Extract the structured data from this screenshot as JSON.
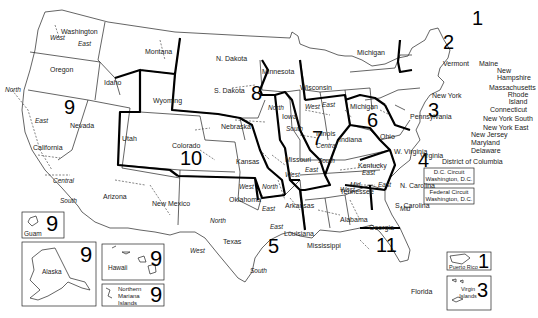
{
  "map": {
    "title": "Federal Judicial Circuits and Districts",
    "circuit_numbers": {
      "c1": "1",
      "c2": "2",
      "c3": "3",
      "c4": "4",
      "c5": "5",
      "c6": "6",
      "c7": "7",
      "c8": "8",
      "c9": "9",
      "c10": "10",
      "c11": "11"
    },
    "states": {
      "washington": "Washington",
      "oregon": "Oregon",
      "idaho": "Idaho",
      "montana": "Montana",
      "wyoming": "Wyoming",
      "nevada": "Nevada",
      "california": "California",
      "utah": "Utah",
      "colorado": "Colorado",
      "arizona": "Arizona",
      "new_mexico": "New Mexico",
      "n_dakota": "N. Dakota",
      "s_dakota": "S. Dakota",
      "nebraska": "Nebraska",
      "kansas": "Kansas",
      "oklahoma": "Oklahoma",
      "texas": "Texas",
      "minnesota": "Minnesota",
      "iowa": "Iowa",
      "missouri": "Missouri",
      "arkansas": "Arkansas",
      "louisiana": "Louisiana",
      "wisconsin": "Wisconsin",
      "illinois": "Illinois",
      "michigan": "Michigan",
      "indiana": "Indiana",
      "ohio": "Ohio",
      "kentucky": "Kentucky",
      "tennessee": "Tennessee",
      "mississippi": "Mississippi",
      "alabama": "Alabama",
      "georgia": "Georgia",
      "florida": "Florida",
      "s_carolina": "S. Carolina",
      "n_carolina": "N. Carolina",
      "virginia": "Virginia",
      "w_virginia": "W. Virginia",
      "pennsylvania": "Pennsylvania",
      "new_york": "New York",
      "vermont": "Vermont",
      "maine": "Maine",
      "new_hampshire": "New Hampshire",
      "massachusetts": "Massachusetts",
      "rhode_island": "Rhode Island",
      "connecticut": "Connecticut",
      "new_york_south": "New York South",
      "new_york_east": "New York East",
      "new_jersey": "New Jersey",
      "maryland": "Maryland",
      "delaware": "Delaware",
      "dc": "District of Columbia"
    },
    "districts": {
      "west": "West",
      "east": "East",
      "north": "North",
      "south": "South",
      "central": "Central",
      "mid": "Mid"
    },
    "insets": {
      "guam": {
        "label": "Guam",
        "circuit": "9"
      },
      "alaska": {
        "label": "Alaska",
        "circuit": "9"
      },
      "hawaii": {
        "label": "Hawaii",
        "circuit": "9"
      },
      "nmi": {
        "label": "Northern Mariana Islands",
        "circuit": "9"
      },
      "puerto_rico": {
        "label": "Puerto Rico",
        "circuit": "1"
      },
      "virgin_islands": {
        "label": "Virgin Islands",
        "circuit": "3"
      }
    },
    "dc_circuit": {
      "line1": "D.C. Circuit",
      "line2": "Washington, D.C."
    },
    "federal_circuit": {
      "line1": "Federal Circuit",
      "line2": "Washington, D.C."
    }
  }
}
